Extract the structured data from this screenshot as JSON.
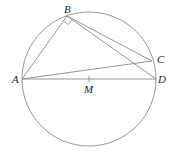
{
  "diagram": {
    "type": "geometry",
    "colors": {
      "line": "#8a8a8a",
      "text": "#222222",
      "background": "#ffffff"
    },
    "circle": {
      "center": "M",
      "cx": 89,
      "cy": 79,
      "r": 67
    },
    "points": {
      "A": {
        "x": 22,
        "y": 79,
        "label": "A"
      },
      "B": {
        "x": 67,
        "y": 16,
        "label": "B"
      },
      "C": {
        "x": 152,
        "y": 61,
        "label": "C"
      },
      "D": {
        "x": 156,
        "y": 79,
        "label": "D"
      },
      "M": {
        "x": 89,
        "y": 79,
        "label": "M"
      }
    },
    "segments": [
      "AB",
      "BC",
      "BD",
      "AC",
      "AD"
    ],
    "right_angle": {
      "at": "B",
      "between": [
        "A",
        "D"
      ]
    }
  }
}
